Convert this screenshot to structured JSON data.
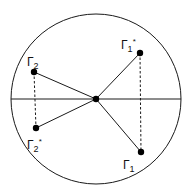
{
  "diagram": {
    "type": "complex-plane-root-diagram",
    "colors": {
      "stroke": "#1a1a1a",
      "point": "#000000",
      "background": "#ffffff"
    },
    "circle": {
      "cx": 96,
      "cy": 99,
      "r": 85
    },
    "axis": {
      "x1": 11,
      "y1": 99,
      "x2": 181,
      "y2": 99
    },
    "center_point": {
      "x": 96,
      "y": 99
    },
    "points": [
      {
        "id": "gamma2",
        "label": "Γ2",
        "base": "Γ",
        "sub": "2",
        "sup": "",
        "x": 34,
        "y": 72,
        "label_x": 27,
        "label_y": 66
      },
      {
        "id": "gamma2-star",
        "label": "Γ2*",
        "base": "Γ",
        "sub": "2",
        "sup": "*",
        "x": 36,
        "y": 128,
        "label_x": 27,
        "label_y": 149
      },
      {
        "id": "gamma1-star",
        "label": "Γ1*",
        "base": "Γ",
        "sub": "1",
        "sup": "*",
        "x": 140,
        "y": 53,
        "label_x": 121,
        "label_y": 49
      },
      {
        "id": "gamma1",
        "label": "Γ1",
        "base": "Γ",
        "sub": "1",
        "sup": "",
        "x": 141,
        "y": 152,
        "label_x": 123,
        "label_y": 169
      }
    ],
    "solid_edges": [
      {
        "from": "center",
        "to": "gamma2"
      },
      {
        "from": "center",
        "to": "gamma2-star"
      },
      {
        "from": "center",
        "to": "gamma1-star"
      },
      {
        "from": "center",
        "to": "gamma1"
      }
    ],
    "dashed_edges": [
      {
        "from": "gamma2",
        "to": "gamma2-star"
      },
      {
        "from": "gamma1-star",
        "to": "gamma1"
      }
    ]
  }
}
